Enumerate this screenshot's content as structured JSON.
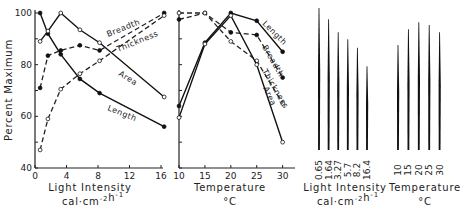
{
  "chart_data": [
    {
      "type": "line",
      "title": "",
      "xlabel": "Light Intensity",
      "xlabel_units": "cal·cm⁻²h⁻¹",
      "ylabel": "Percent Maximum",
      "xlim": [
        0,
        16
      ],
      "ylim": [
        40,
        100
      ],
      "xticks": [
        0,
        4,
        8,
        12,
        16
      ],
      "yticks": [
        40,
        60,
        80,
        100
      ],
      "grid": false,
      "series": [
        {
          "name": "Length",
          "style": "solid",
          "marker": "filled",
          "x": [
            0.65,
            1.64,
            3.27,
            5.7,
            8.2,
            16.4
          ],
          "values": [
            100,
            92,
            84,
            74.5,
            69,
            56
          ]
        },
        {
          "name": "Area",
          "style": "solid",
          "marker": "open",
          "x": [
            0.65,
            1.64,
            3.27,
            5.7,
            8.2,
            16.4
          ],
          "values": [
            89,
            93,
            100,
            93.5,
            88.5,
            67.5
          ]
        },
        {
          "name": "Breadth",
          "style": "dashed",
          "marker": "filled",
          "x": [
            0.65,
            1.64,
            3.27,
            5.7,
            8.2,
            16.4
          ],
          "values": [
            71,
            83.5,
            85.5,
            87.5,
            85.5,
            100
          ]
        },
        {
          "name": "Thickness",
          "style": "dashed",
          "marker": "open",
          "x": [
            0.65,
            1.64,
            3.27,
            5.7,
            8.2,
            16.4
          ],
          "values": [
            47,
            59,
            70.5,
            76.5,
            81.5,
            99
          ]
        }
      ],
      "series_label_positions": {
        "Breadth": [
          108,
          37,
          -22
        ],
        "Thickness": [
          118,
          52,
          -22
        ],
        "Area": [
          118,
          75,
          32
        ],
        "Length": [
          107,
          110,
          22
        ]
      }
    },
    {
      "type": "line",
      "title": "",
      "xlabel": "Temperature",
      "xlabel_units": "°C",
      "ylabel": "",
      "xlim": [
        10,
        32
      ],
      "ylim": [
        40,
        100
      ],
      "xticks": [
        10,
        15,
        20,
        25,
        30
      ],
      "grid": false,
      "series": [
        {
          "name": "Length",
          "style": "solid",
          "marker": "filled",
          "x": [
            10,
            15,
            20,
            25,
            30
          ],
          "values": [
            64,
            88.5,
            100,
            97,
            85
          ]
        },
        {
          "name": "Breadth",
          "style": "dashed",
          "marker": "filled",
          "x": [
            10,
            15,
            20,
            25,
            30
          ],
          "values": [
            97.5,
            100,
            92.5,
            91.5,
            75
          ]
        },
        {
          "name": "Thickness",
          "style": "dashed",
          "marker": "open",
          "x": [
            10,
            15,
            20,
            25,
            30
          ],
          "values": [
            100,
            100,
            89,
            81.5,
            65
          ]
        },
        {
          "name": "Area",
          "style": "solid",
          "marker": "open",
          "x": [
            10,
            15,
            20,
            25,
            30
          ],
          "values": [
            59.5,
            88,
            99,
            80,
            50
          ]
        }
      ],
      "series_label_positions": {
        "Length": [
          262,
          24,
          45
        ],
        "Breadth": [
          262,
          47,
          60
        ],
        "Thickness": [
          262,
          71,
          60
        ],
        "Area": [
          263,
          88,
          65
        ]
      }
    },
    {
      "type": "bar",
      "title": "",
      "xlabel": "Light Intensity",
      "xlabel_units": "cal·cm⁻²h⁻¹",
      "categories": [
        "0.65",
        "1.64",
        "3.27",
        "5.7",
        "8.2",
        "16.4"
      ],
      "values": [
        100,
        92,
        83,
        78,
        72,
        59
      ],
      "bar_style": "thin tapered vertical lines (relative size profile)"
    },
    {
      "type": "bar",
      "title": "",
      "xlabel": "Temperature",
      "xlabel_units": "°C",
      "categories": [
        "10",
        "15",
        "20",
        "25",
        "30"
      ],
      "values": [
        74,
        85,
        90,
        88,
        83
      ],
      "bar_style": "thin tapered vertical lines (relative size profile)"
    }
  ],
  "labels": {
    "ylabel": "Percent Maximum",
    "left_xlabel": "Light Intensity",
    "left_xunits": "cal·cm-2h-1",
    "mid_xlabel": "Temperature",
    "mid_xunits": "°C",
    "right1_xlabel": "Light Intensity",
    "right1_xunits": "cal·cm-2h-1",
    "right2_xlabel": "Temperature",
    "right2_xunits": "°C"
  }
}
